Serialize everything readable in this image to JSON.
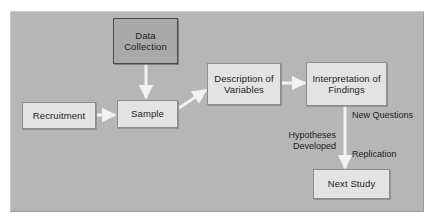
{
  "diagram": {
    "background_color": "#b6b6b6",
    "page_color": "#ffffff",
    "arrow_color": "#f2f2f2",
    "nodes": [
      {
        "id": "data-collection",
        "label": "Data\nCollection",
        "style": "dark",
        "fill": "#a9a9a9",
        "border": "#4a4a4a"
      },
      {
        "id": "recruitment",
        "label": "Recruitment",
        "style": "light",
        "fill": "#e3e3e3",
        "border": "#8d8d8d"
      },
      {
        "id": "sample",
        "label": "Sample",
        "style": "light",
        "fill": "#e3e3e3",
        "border": "#8d8d8d"
      },
      {
        "id": "description",
        "label": "Description\nof Variables",
        "style": "light",
        "fill": "#e3e3e3",
        "border": "#8d8d8d"
      },
      {
        "id": "interpretation",
        "label": "Interpretation\nof Findings",
        "style": "light",
        "fill": "#e3e3e3",
        "border": "#8d8d8d"
      },
      {
        "id": "next-study",
        "label": "Next Study",
        "style": "light",
        "fill": "#e3e3e3",
        "border": "#8d8d8d"
      }
    ],
    "edge_labels": [
      {
        "id": "hypotheses-developed",
        "text": "Hypotheses\nDeveloped"
      },
      {
        "id": "new-questions",
        "text": "New Questions"
      },
      {
        "id": "replication",
        "text": "Replication"
      }
    ],
    "edges": [
      {
        "from": "recruitment",
        "to": "sample",
        "direction": "right"
      },
      {
        "from": "data-collection",
        "to": "sample",
        "direction": "down"
      },
      {
        "from": "sample",
        "to": "description",
        "direction": "up-right"
      },
      {
        "from": "description",
        "to": "interpretation",
        "direction": "right"
      },
      {
        "from": "interpretation",
        "to": "next-study",
        "direction": "down"
      }
    ]
  }
}
